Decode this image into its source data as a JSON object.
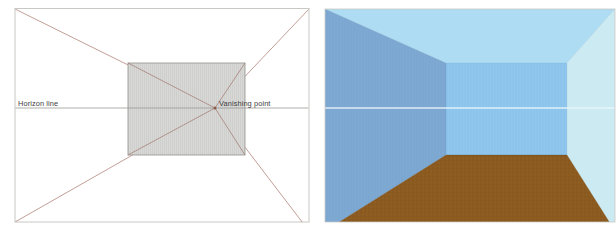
{
  "figure": {
    "type": "one-point-perspective-illustration",
    "panels": [
      {
        "id": "diagram",
        "name": "perspective-construction-diagram",
        "background_color": "#ffffff",
        "border_color": "#c8c8c4",
        "labels": [
          {
            "id": "horizon-line",
            "text": "Horizon line",
            "x": 18,
            "y": 106
          },
          {
            "id": "vanishing-point",
            "text": "Vanishing point",
            "x": 219,
            "y": 106
          }
        ],
        "horizon_line": {
          "label": "Horizon line",
          "color": "#9a9a98",
          "y": 108,
          "x_start": 15,
          "x_end": 309
        },
        "vanishing_point": {
          "label": "Vanishing point",
          "x": 215,
          "y": 108,
          "dot_color": "#8a5a4a"
        },
        "back_plane": {
          "name": "back-wall-square",
          "fill": "#d6d6d4",
          "stroke": "#9c9c99",
          "left": 128,
          "top": 63,
          "right": 245,
          "bottom": 155
        },
        "orthogonal_lines": {
          "color": "#a8766a",
          "count": 4,
          "description": "receding lines from image corners through the back plane corners to the vanishing point"
        }
      },
      {
        "id": "render",
        "name": "perspective-room-render",
        "surfaces": [
          {
            "id": "ceiling",
            "name": "ceiling-surface",
            "color": "#aedcf2"
          },
          {
            "id": "left-wall",
            "name": "left-wall-surface",
            "color": "#7ba7d0"
          },
          {
            "id": "back-wall",
            "name": "back-wall-surface",
            "color": "#8cc4ec"
          },
          {
            "id": "right-wall",
            "name": "right-wall-surface",
            "color": "#cceaf2"
          },
          {
            "id": "floor",
            "name": "floor-surface",
            "color": "#8b5a20"
          }
        ],
        "horizon_line": {
          "color": "#eaf6fb",
          "y": 108
        },
        "back_wall_rect": {
          "left": 136,
          "top": 63,
          "right": 257,
          "bottom": 155
        },
        "border_color": "#c8c8c4"
      }
    ]
  }
}
